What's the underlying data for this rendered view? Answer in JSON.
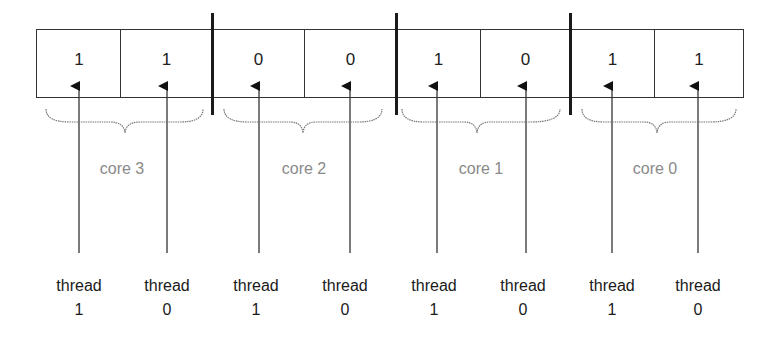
{
  "diagram": {
    "cells": [
      {
        "value": "1",
        "core": "core 3",
        "thread": "thread 1"
      },
      {
        "value": "1",
        "core": "core 3",
        "thread": "thread 0"
      },
      {
        "value": "0",
        "core": "core 2",
        "thread": "thread 1"
      },
      {
        "value": "0",
        "core": "core 2",
        "thread": "thread 0"
      },
      {
        "value": "1",
        "core": "core 1",
        "thread": "thread 1"
      },
      {
        "value": "0",
        "core": "core 1",
        "thread": "thread 0"
      },
      {
        "value": "1",
        "core": "core 0",
        "thread": "thread 1"
      },
      {
        "value": "1",
        "core": "core 0",
        "thread": "thread 0"
      }
    ],
    "cores": [
      {
        "label": "core 3"
      },
      {
        "label": "core 2"
      },
      {
        "label": "core 1"
      },
      {
        "label": "core 0"
      }
    ],
    "threads": [
      {
        "word": "thread",
        "num": "1"
      },
      {
        "word": "thread",
        "num": "0"
      },
      {
        "word": "thread",
        "num": "1"
      },
      {
        "word": "thread",
        "num": "0"
      },
      {
        "word": "thread",
        "num": "1"
      },
      {
        "word": "thread",
        "num": "0"
      },
      {
        "word": "thread",
        "num": "1"
      },
      {
        "word": "thread",
        "num": "0"
      }
    ],
    "colors": {
      "line": "#333333",
      "core_label": "#8a8a8a",
      "brace": "#777777"
    }
  }
}
